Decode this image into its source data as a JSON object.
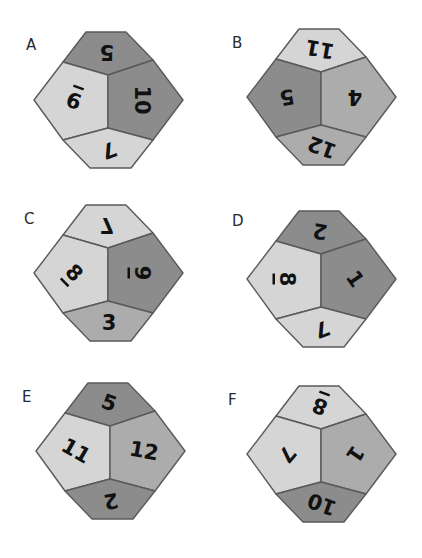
{
  "colors": {
    "light": "#d5d5d5",
    "medium": "#acacac",
    "dark": "#8c8c8c",
    "outline": "#5a5a5a",
    "number": "#111111"
  },
  "dice": [
    {
      "label": "A",
      "x": 34,
      "y": 32,
      "label_x": 26,
      "label_y": 36,
      "faces": {
        "top": {
          "value": "5",
          "shade": "dark",
          "rot": 180,
          "flip": false
        },
        "left": {
          "value": "9",
          "shade": "light",
          "rot": 200,
          "flip": false,
          "underline": true
        },
        "right": {
          "value": "10",
          "shade": "dark",
          "rot": 90,
          "flip": false
        },
        "bottom": {
          "value": "7",
          "shade": "light",
          "rot": 160,
          "flip": false
        }
      }
    },
    {
      "label": "B",
      "x": 247,
      "y": 29,
      "label_x": 232,
      "label_y": 34,
      "faces": {
        "top": {
          "value": "11",
          "shade": "light",
          "rot": 190,
          "flip": false
        },
        "left": {
          "value": "5",
          "shade": "dark",
          "rot": 170,
          "flip": false
        },
        "right": {
          "value": "4",
          "shade": "medium",
          "rot": 180,
          "flip": false
        },
        "bottom": {
          "value": "12",
          "shade": "medium",
          "rot": 200,
          "flip": false
        }
      }
    },
    {
      "label": "C",
      "x": 34,
      "y": 205,
      "label_x": 24,
      "label_y": 210,
      "faces": {
        "top": {
          "value": "7",
          "shade": "light",
          "rot": 180,
          "flip": true
        },
        "left": {
          "value": "8",
          "shade": "light",
          "rot": 45,
          "flip": false,
          "underline": true
        },
        "right": {
          "value": "9",
          "shade": "dark",
          "rot": 90,
          "flip": false,
          "underline": true
        },
        "bottom": {
          "value": "3",
          "shade": "medium",
          "rot": 0,
          "flip": false
        }
      }
    },
    {
      "label": "D",
      "x": 247,
      "y": 211,
      "label_x": 232,
      "label_y": 212,
      "faces": {
        "top": {
          "value": "2",
          "shade": "dark",
          "rot": 190,
          "flip": false
        },
        "left": {
          "value": "8",
          "shade": "light",
          "rot": 90,
          "flip": false,
          "underline": true
        },
        "right": {
          "value": "1",
          "shade": "dark",
          "rot": 55,
          "flip": false
        },
        "bottom": {
          "value": "7",
          "shade": "light",
          "rot": 160,
          "flip": false
        }
      }
    },
    {
      "label": "E",
      "x": 36,
      "y": 383,
      "label_x": 22,
      "label_y": 388,
      "faces": {
        "top": {
          "value": "5",
          "shade": "dark",
          "rot": 20,
          "flip": false
        },
        "left": {
          "value": "11",
          "shade": "light",
          "rot": 30,
          "flip": false
        },
        "right": {
          "value": "12",
          "shade": "medium",
          "rot": 10,
          "flip": false
        },
        "bottom": {
          "value": "2",
          "shade": "dark",
          "rot": 170,
          "flip": false
        }
      }
    },
    {
      "label": "F",
      "x": 247,
      "y": 386,
      "label_x": 228,
      "label_y": 391,
      "faces": {
        "top": {
          "value": "8",
          "shade": "light",
          "rot": 200,
          "flip": false,
          "underline": true
        },
        "left": {
          "value": "7",
          "shade": "light",
          "rot": 130,
          "flip": false
        },
        "right": {
          "value": "1",
          "shade": "medium",
          "rot": 125,
          "flip": false
        },
        "bottom": {
          "value": "10",
          "shade": "dark",
          "rot": 200,
          "flip": false
        }
      }
    }
  ]
}
